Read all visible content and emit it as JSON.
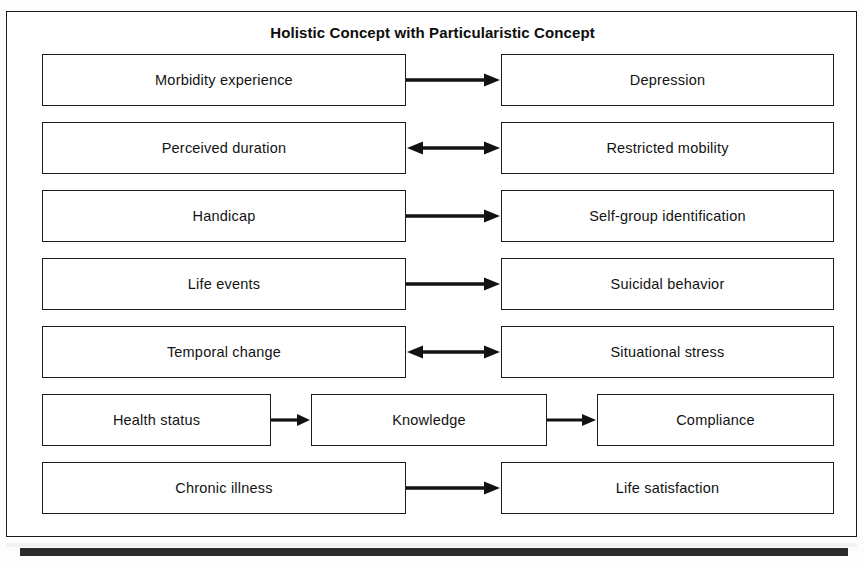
{
  "figure": {
    "title": "Holistic Concept with Particularistic Concept",
    "rows": [
      {
        "id": "row-morbidity-depression",
        "nodes": [
          {
            "label": "Morbidity experience"
          },
          {
            "label": "Depression"
          }
        ],
        "connectors": [
          {
            "direction": "single"
          }
        ]
      },
      {
        "id": "row-duration-mobility",
        "nodes": [
          {
            "label": "Perceived duration"
          },
          {
            "label": "Restricted mobility"
          }
        ],
        "connectors": [
          {
            "direction": "double"
          }
        ]
      },
      {
        "id": "row-handicap-selfgroup",
        "nodes": [
          {
            "label": "Handicap"
          },
          {
            "label": "Self-group identification"
          }
        ],
        "connectors": [
          {
            "direction": "single"
          }
        ]
      },
      {
        "id": "row-lifeevents-suicidal",
        "nodes": [
          {
            "label": "Life events"
          },
          {
            "label": "Suicidal behavior"
          }
        ],
        "connectors": [
          {
            "direction": "single"
          }
        ]
      },
      {
        "id": "row-temporal-situational",
        "nodes": [
          {
            "label": "Temporal change"
          },
          {
            "label": "Situational stress"
          }
        ],
        "connectors": [
          {
            "direction": "double"
          }
        ]
      },
      {
        "id": "row-health-knowledge-compliance",
        "nodes": [
          {
            "label": "Health status"
          },
          {
            "label": "Knowledge"
          },
          {
            "label": "Compliance"
          }
        ],
        "connectors": [
          {
            "direction": "single"
          },
          {
            "direction": "single"
          }
        ]
      },
      {
        "id": "row-chronic-lifesatisfaction",
        "nodes": [
          {
            "label": "Chronic illness"
          },
          {
            "label": "Life satisfaction"
          }
        ],
        "connectors": [
          {
            "direction": "single"
          }
        ]
      }
    ]
  },
  "colors": {
    "border": "#1c1c1c",
    "frame": "#1a1a1a",
    "text": "#131313",
    "background": "#ffffff"
  }
}
